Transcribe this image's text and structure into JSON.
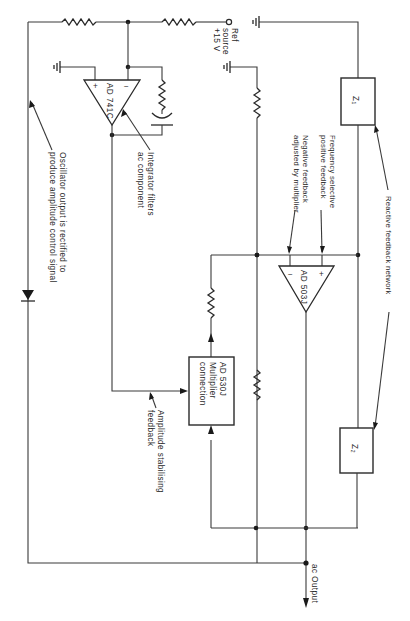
{
  "diagram": {
    "type": "circuit-schematic",
    "components": {
      "ref_source": {
        "label_line1": "Ref",
        "label_line2": "source",
        "label_line3": "+15 V"
      },
      "integrator_opamp": {
        "name": "AD 741C",
        "plus": "+",
        "minus": "−"
      },
      "main_opamp": {
        "name": "AD 503J",
        "plus": "+",
        "minus": "−"
      },
      "multiplier": {
        "line1": "AD 530J",
        "line2": "Multiplier",
        "line3": "connection"
      },
      "z1": {
        "label": "Z₁"
      },
      "z2": {
        "label": "Z₂"
      },
      "output": {
        "label": "ac Output"
      }
    },
    "annotations": {
      "oscillator_line1": "Oscillator output is rectified to",
      "oscillator_line2": "produce amplitude control signal",
      "integrator_line1": "Integrator filters",
      "integrator_line2": "ac component",
      "freq_line1": "Frequency selective",
      "freq_line2": "positive feedback",
      "neg_line1": "Negative feedback",
      "neg_line2": "adjusted by multiplier",
      "reactive": "Reactive feedback network",
      "amp_line1": "Amplitude stabilising",
      "amp_line2": "feedback"
    }
  }
}
